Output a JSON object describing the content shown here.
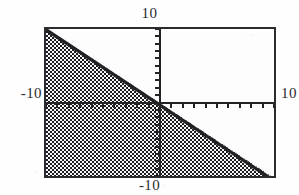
{
  "figure": {
    "kind": "inequality-region-plot",
    "frame": {
      "left": 44,
      "top": 27,
      "width": 232,
      "height": 151,
      "border_color": "#2b2b30"
    },
    "background_color": "#fefeff",
    "plot_background_color": "#fdfdfe",
    "shading_color": "#1d1d21",
    "axis_color": "#232327",
    "labels": {
      "top": "10",
      "bottom": "-10",
      "left": "-10",
      "right": "10"
    }
  },
  "chart_data": {
    "type": "area",
    "title": "",
    "subtitle": "",
    "xlabel": "",
    "ylabel": "",
    "xlim": [
      -10,
      10
    ],
    "ylim": [
      -10,
      10
    ],
    "xticks": [
      -10,
      -8,
      -6,
      -4,
      -2,
      0,
      2,
      4,
      6,
      8,
      10
    ],
    "xtick_labels": [
      "-10",
      "",
      "",
      "",
      "",
      "",
      "",
      "",
      "",
      "",
      "10"
    ],
    "yticks": [
      -10,
      -8,
      -6,
      -4,
      -2,
      0,
      2,
      4,
      6,
      8,
      10
    ],
    "ytick_labels": [
      "-10",
      "",
      "",
      "",
      "",
      "",
      "",
      "",
      "",
      "",
      "10"
    ],
    "tick_interval": 1,
    "grid": false,
    "legend": "none",
    "axes_style": "crossed-at-origin-with-frame",
    "shaded_region": {
      "fill": "checkerboard-dither",
      "description": "region on and below the boundary line",
      "boundary": {
        "style": "solid",
        "points": [
          [
            -10,
            10
          ],
          [
            10,
            -10
          ]
        ],
        "slope": -1,
        "intercept": 0,
        "equation": "y = -x"
      },
      "inequality": "y <= -x",
      "vertices": [
        [
          -10,
          10
        ],
        [
          10,
          -10
        ],
        [
          -10,
          -10
        ]
      ]
    },
    "annotations": [
      {
        "text": "10",
        "position": "top",
        "value": 10
      },
      {
        "text": "-10",
        "position": "left",
        "value": -10
      },
      {
        "text": "10",
        "position": "right",
        "value": 10
      },
      {
        "text": "-10",
        "position": "bottom",
        "value": -10
      }
    ]
  }
}
